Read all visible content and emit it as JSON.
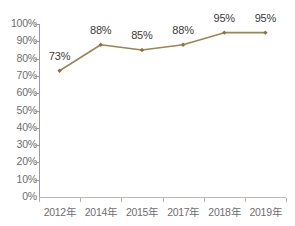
{
  "chart_data": {
    "type": "line",
    "title": "",
    "subtitle": "",
    "xlabel": "",
    "ylabel": "",
    "categories": [
      "2012年",
      "2014年",
      "2015年",
      "2017年",
      "2018年",
      "2019年"
    ],
    "values": [
      73,
      88,
      85,
      88,
      95,
      95
    ],
    "data_labels": [
      "73%",
      "88%",
      "85%",
      "88%",
      "95%",
      "95%"
    ],
    "ylim": [
      0,
      100
    ],
    "ytick_labels": [
      "0%",
      "10%",
      "20%",
      "30%",
      "40%",
      "50%",
      "60%",
      "70%",
      "80%",
      "90%",
      "100%"
    ],
    "ytick_values": [
      0,
      10,
      20,
      30,
      40,
      50,
      60,
      70,
      80,
      90,
      100
    ],
    "grid": false,
    "legend": false,
    "legend_position": "none",
    "series": [
      {
        "name": "",
        "values": [
          73,
          88,
          85,
          88,
          95,
          95
        ],
        "marker": "diamond"
      }
    ]
  },
  "style": {
    "line_color": "#9d8450",
    "marker_color": "#8a7340",
    "y_axis_color": "#9a9a9a",
    "x_axis_color": "#c7b2b2",
    "tick_label_color": "#6e6e6e",
    "data_label_color": "#3a3a3a",
    "background": "#ffffff"
  }
}
